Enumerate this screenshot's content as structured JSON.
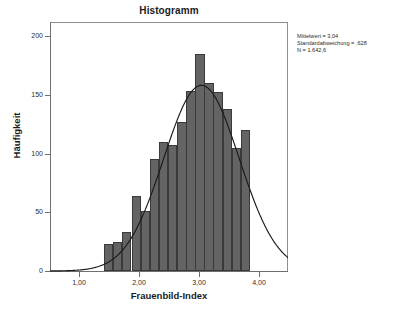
{
  "chart_data": {
    "type": "bar",
    "title": "Histogramm",
    "xlabel": "Frauenbild-Index",
    "ylabel": "Häufigkeit",
    "grid": false,
    "legend": "none",
    "xlim": [
      0.52,
      4.48
    ],
    "ylim": [
      0,
      212
    ],
    "xtick_labels": [
      "1,00",
      "2,00",
      "3,00",
      "4,00"
    ],
    "xtick_values": [
      1.0,
      2.0,
      3.0,
      4.0
    ],
    "ytick_labels": [
      "0",
      "50",
      "100",
      "150",
      "200"
    ],
    "ytick_values": [
      0,
      50,
      100,
      150,
      200
    ],
    "bin_width": 0.1515,
    "bin_starts": [
      1.42,
      1.57,
      1.72,
      1.88,
      2.03,
      2.18,
      2.33,
      2.48,
      2.64,
      2.79,
      2.94,
      3.09,
      3.24,
      3.4,
      3.55,
      3.7,
      3.85
    ],
    "categories": [
      "1,42",
      "1,57",
      "1,72",
      "1,88",
      "2,03",
      "2,18",
      "2,33",
      "2,48",
      "2,64",
      "2,79",
      "2,94",
      "3,09",
      "3,24",
      "3,40",
      "3,55",
      "3,70",
      "3,85"
    ],
    "values": [
      23,
      25,
      33,
      64,
      51,
      95,
      110,
      107,
      127,
      153,
      185,
      160,
      152,
      138,
      105,
      120,
      0
    ],
    "overlay": {
      "type": "normal-curve",
      "mean": 3.04,
      "sd": 0.628,
      "n": 1642.6
    }
  },
  "annotation": {
    "line1": "Mittelwert = 3,04",
    "line2": "Standardabweichung = ,628",
    "line3": "N = 1.642,6"
  },
  "colors": {
    "bar_fill": "#646464",
    "bar_edge": "#3a3a3a",
    "curve": "#1a1a1a",
    "axis": "#6d7073",
    "frame": "#8d9093",
    "background": "#ffffff",
    "text": "#1b1b1b"
  }
}
